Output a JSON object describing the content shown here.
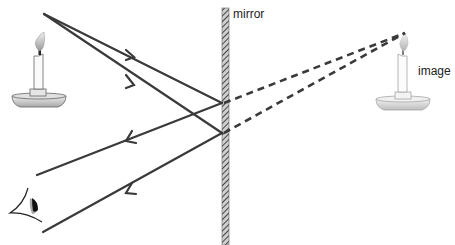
{
  "diagram": {
    "labels": {
      "mirror": "mirror",
      "image": "image"
    },
    "objects": [
      {
        "name": "candle-object",
        "position": "left",
        "flame": [
          44,
          14
        ]
      },
      {
        "name": "candle-image",
        "position": "right",
        "flame": [
          405,
          33
        ]
      },
      {
        "name": "eye",
        "position": "bottom-left"
      },
      {
        "name": "plane-mirror",
        "x": 225,
        "y_range": [
          8,
          245
        ]
      }
    ],
    "rays": {
      "incident": [
        {
          "from": [
            44,
            14
          ],
          "to": [
            222,
            103
          ]
        },
        {
          "from": [
            44,
            14
          ],
          "to": [
            222,
            133
          ]
        }
      ],
      "reflected": [
        {
          "from": [
            222,
            103
          ],
          "to": [
            37,
            175
          ]
        },
        {
          "from": [
            222,
            133
          ],
          "to": [
            43,
            232
          ]
        }
      ],
      "virtual": [
        {
          "from": [
            222,
            103
          ],
          "to": [
            405,
            33
          ]
        },
        {
          "from": [
            222,
            133
          ],
          "to": [
            405,
            33
          ]
        }
      ]
    },
    "colors": {
      "ray": "#3a3a3a",
      "mirror": "#555555",
      "candle_outline": "#555555"
    }
  }
}
